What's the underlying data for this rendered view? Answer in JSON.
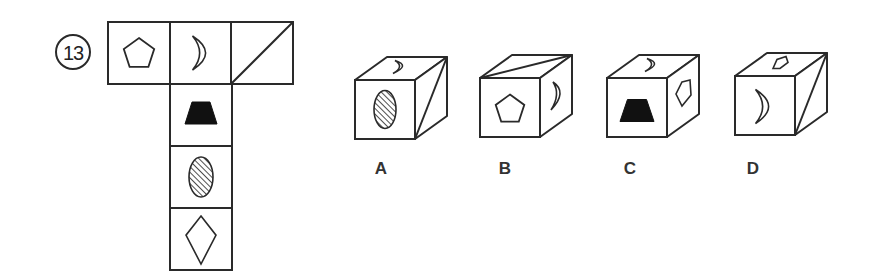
{
  "question": {
    "number": "13",
    "circle": {
      "cx": 73,
      "cy": 52,
      "r": 17
    }
  },
  "colors": {
    "stroke": "#2a2a2a",
    "fill_dark": "#111111",
    "label": "#333333",
    "background": "#ffffff"
  },
  "net": {
    "cell_size": 62,
    "cells": [
      {
        "id": "top-1",
        "x": 108,
        "y": 22,
        "symbol": "pentagon"
      },
      {
        "id": "top-2",
        "x": 170,
        "y": 22,
        "symbol": "crescent"
      },
      {
        "id": "top-3",
        "x": 231,
        "y": 22,
        "symbol": "diagonal"
      },
      {
        "id": "col-1",
        "x": 170,
        "y": 84,
        "symbol": "trapezoid-filled"
      },
      {
        "id": "col-2",
        "x": 170,
        "y": 146,
        "symbol": "hatched-oval"
      },
      {
        "id": "col-3",
        "x": 170,
        "y": 208,
        "symbol": "diamond"
      }
    ]
  },
  "options": [
    {
      "label": "A",
      "x": 355,
      "y": 80,
      "label_x": 381,
      "label_y": 160,
      "front": "hatched-oval",
      "top": "crescent-top",
      "right": "diagonal-right"
    },
    {
      "label": "B",
      "x": 480,
      "y": 78,
      "label_x": 505,
      "label_y": 160,
      "front": "pentagon",
      "top": "diagonal-top",
      "right": "crescent-right"
    },
    {
      "label": "C",
      "x": 607,
      "y": 78,
      "label_x": 630,
      "label_y": 160,
      "front": "trapezoid-filled",
      "top": "crescent-top",
      "right": "pentagon-right"
    },
    {
      "label": "D",
      "x": 735,
      "x_note": "",
      "y": 76,
      "label_x": 753,
      "label_y": 160,
      "front": "crescent",
      "top": "pentagon-top",
      "right": "diagonal-right"
    }
  ],
  "cube_geom": {
    "w": 60,
    "h": 59,
    "dx": 32,
    "dy": -23
  }
}
